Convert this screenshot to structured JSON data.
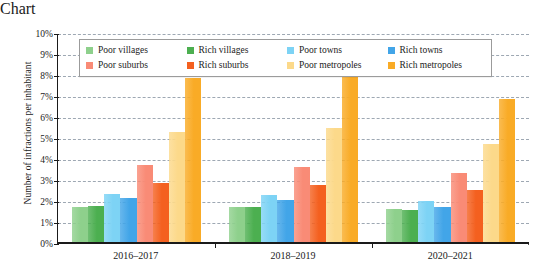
{
  "chart_data": {
    "type": "bar",
    "title": "",
    "xlabel": "",
    "ylabel": "Number of infractions per inhabitant",
    "ylim": [
      0,
      10
    ],
    "y_unit": "%",
    "grid": true,
    "legend_position": "top-inside",
    "categories": [
      "2016–2017",
      "2018–2019",
      "2020–2021"
    ],
    "y_tick_labels": [
      "10%",
      "9%",
      "8%",
      "7%",
      "6%",
      "5%",
      "4%",
      "3%",
      "2%",
      "1%",
      "0%"
    ],
    "y_tick_values": [
      10,
      9,
      8,
      7,
      6,
      5,
      4,
      3,
      2,
      1,
      0
    ],
    "series": [
      {
        "name": "Poor villages",
        "color": "#8ed08c",
        "values": [
          1.7,
          1.7,
          1.6
        ]
      },
      {
        "name": "Rich villages",
        "color": "#4caf50",
        "values": [
          1.75,
          1.7,
          1.53
        ]
      },
      {
        "name": "Poor towns",
        "color": "#7dd3f5",
        "values": [
          2.3,
          2.25,
          1.98
        ]
      },
      {
        "name": "Rich towns",
        "color": "#42a5e8",
        "values": [
          2.13,
          2.02,
          1.7
        ]
      },
      {
        "name": "Poor suburbs",
        "color": "#f98b76",
        "values": [
          3.72,
          3.6,
          3.3
        ]
      },
      {
        "name": "Rich suburbs",
        "color": "#f4601f",
        "values": [
          2.85,
          2.73,
          2.48
        ]
      },
      {
        "name": "Poor metropoles",
        "color": "#fcd98a",
        "values": [
          5.3,
          5.48,
          4.72
        ]
      },
      {
        "name": "Rich metropoles",
        "color": "#f9ab26",
        "values": [
          7.88,
          8.4,
          6.88
        ]
      }
    ]
  },
  "legend": {
    "items": [
      {
        "label": "Poor villages",
        "swatch": "#8ed08c"
      },
      {
        "label": "Rich villages",
        "swatch": "#4caf50"
      },
      {
        "label": "Poor towns",
        "swatch": "#7dd3f5"
      },
      {
        "label": "Rich towns",
        "swatch": "#42a5e8"
      },
      {
        "label": "Poor suburbs",
        "swatch": "#f98b76"
      },
      {
        "label": "Rich suburbs",
        "swatch": "#f4601f"
      },
      {
        "label": "Poor metropoles",
        "swatch": "#fcd98a"
      },
      {
        "label": "Rich metropoles",
        "swatch": "#f9ab26"
      }
    ]
  }
}
